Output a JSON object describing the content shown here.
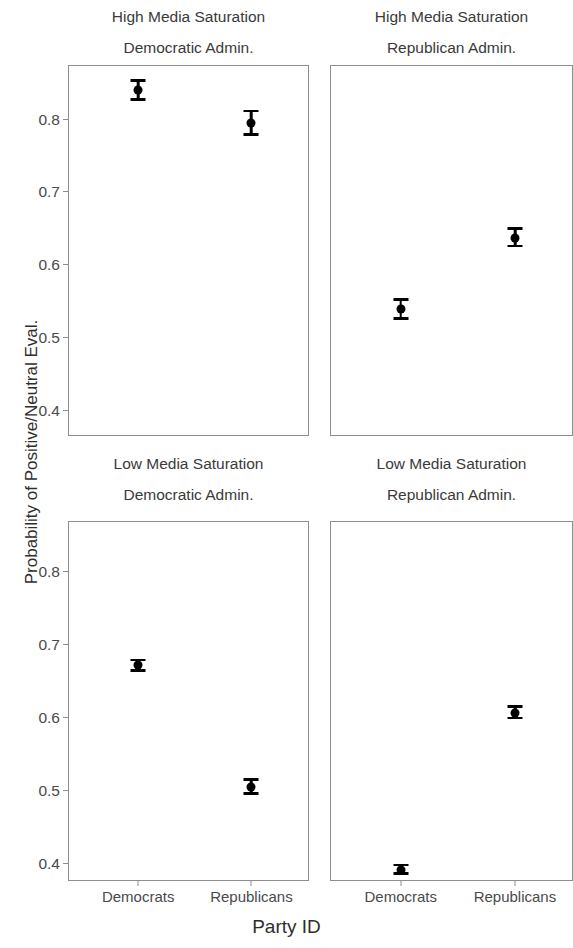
{
  "chart_data": {
    "type": "scatter",
    "title": "",
    "xlabel": "Party ID",
    "ylabel": "Probability of Positive/Neutral Eval.",
    "categories": [
      "Democrats",
      "Republicans"
    ],
    "grid": false,
    "legend": null,
    "error_bars": "95% confidence interval",
    "facet_rows": [
      "High Media Saturation",
      "Low Media Saturation"
    ],
    "facet_cols": [
      "Democratic Admin.",
      "Republican Admin."
    ],
    "panels": [
      {
        "id": "high-democratic",
        "strip_line1": "High Media Saturation",
        "strip_line2": "Democratic Admin.",
        "row": 0,
        "col": 0,
        "ylim": [
          0.363,
          0.873
        ],
        "yticks": [
          0.4,
          0.5,
          0.6,
          0.7,
          0.8
        ],
        "ytick_labels": [
          "0.4",
          "0.5",
          "0.6",
          "0.7",
          "0.8"
        ],
        "points": [
          {
            "x": "Democrats",
            "y": 0.84,
            "lo": 0.825,
            "hi": 0.855
          },
          {
            "x": "Republicans",
            "y": 0.795,
            "lo": 0.777,
            "hi": 0.813
          }
        ]
      },
      {
        "id": "high-republican",
        "strip_line1": "High Media Saturation",
        "strip_line2": "Republican Admin.",
        "row": 0,
        "col": 1,
        "ylim": [
          0.363,
          0.873
        ],
        "yticks": [
          0.4,
          0.5,
          0.6,
          0.7,
          0.8
        ],
        "ytick_labels": [
          "0.4",
          "0.5",
          "0.6",
          "0.7",
          "0.8"
        ],
        "points": [
          {
            "x": "Democrats",
            "y": 0.539,
            "lo": 0.524,
            "hi": 0.554
          },
          {
            "x": "Republicans",
            "y": 0.637,
            "lo": 0.624,
            "hi": 0.651
          }
        ]
      },
      {
        "id": "low-democratic",
        "strip_line1": "Low Media Saturation",
        "strip_line2": "Democratic Admin.",
        "row": 1,
        "col": 0,
        "ylim": [
          0.375,
          0.868
        ],
        "yticks": [
          0.4,
          0.5,
          0.6,
          0.7,
          0.8
        ],
        "ytick_labels": [
          "0.4",
          "0.5",
          "0.6",
          "0.7",
          "0.8"
        ],
        "points": [
          {
            "x": "Democrats",
            "y": 0.672,
            "lo": 0.663,
            "hi": 0.681
          },
          {
            "x": "Republicans",
            "y": 0.505,
            "lo": 0.494,
            "hi": 0.517
          }
        ]
      },
      {
        "id": "low-republican",
        "strip_line1": "Low Media Saturation",
        "strip_line2": "Republican Admin.",
        "row": 1,
        "col": 1,
        "ylim": [
          0.375,
          0.868
        ],
        "yticks": [
          0.4,
          0.5,
          0.6,
          0.7,
          0.8
        ],
        "ytick_labels": [
          "0.4",
          "0.5",
          "0.6",
          "0.7",
          "0.8"
        ],
        "points": [
          {
            "x": "Democrats",
            "y": 0.392,
            "lo": 0.385,
            "hi": 0.4
          },
          {
            "x": "Republicans",
            "y": 0.607,
            "lo": 0.598,
            "hi": 0.617
          }
        ]
      }
    ],
    "colors": {
      "point": "#000000",
      "panel_border": "#8d8d8d",
      "text": "#3a3a3a",
      "background": "#ffffff"
    }
  }
}
